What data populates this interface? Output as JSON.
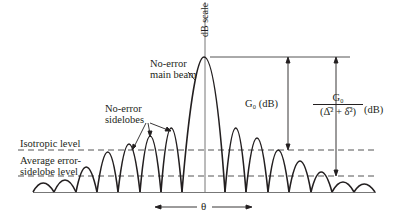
{
  "diagram": {
    "axis_label": "dB scale",
    "main_beam_label": [
      "No-error",
      "main beam"
    ],
    "sidelobes_label": [
      "No-error",
      "sidelobes"
    ],
    "isotropic_label": "Isotropic level",
    "avg_sidelobe_label": [
      "Average error-",
      "sidelobe level"
    ],
    "gain_label": "G₀ (dB)",
    "ratio_numerator": "G₀",
    "ratio_denominator": "(Δ̅² + δ̅²)",
    "ratio_unit": "(dB)",
    "theta_label": "θ",
    "colors": {
      "ink": "#231f20",
      "dash": "#555555",
      "axis": "#666666"
    }
  }
}
